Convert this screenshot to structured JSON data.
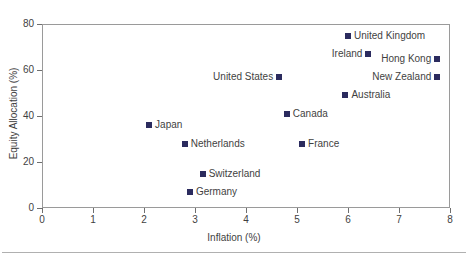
{
  "chart_data": {
    "type": "scatter",
    "title": "",
    "xlabel": "Inflation (%)",
    "ylabel": "Equity Allocation (%)",
    "xlim": [
      0,
      8
    ],
    "ylim": [
      0,
      80
    ],
    "xticks": [
      "0",
      "1",
      "2",
      "3",
      "4",
      "5",
      "6",
      "7",
      "8"
    ],
    "yticks": [
      "0",
      "20",
      "40",
      "60",
      "80"
    ],
    "grid": false,
    "legend": "none",
    "marker_color": "#2b2b5e",
    "points": [
      {
        "label": "United Kingdom",
        "x": 6.0,
        "y": 75,
        "label_side": "right"
      },
      {
        "label": "Ireland",
        "x": 6.4,
        "y": 67,
        "label_side": "left"
      },
      {
        "label": "Hong Kong",
        "x": 7.75,
        "y": 65,
        "label_side": "left"
      },
      {
        "label": "New Zealand",
        "x": 7.75,
        "y": 57,
        "label_side": "left"
      },
      {
        "label": "United States",
        "x": 4.65,
        "y": 57,
        "label_side": "left"
      },
      {
        "label": "Australia",
        "x": 5.95,
        "y": 49,
        "label_side": "right"
      },
      {
        "label": "Canada",
        "x": 4.8,
        "y": 41,
        "label_side": "right"
      },
      {
        "label": "Japan",
        "x": 2.1,
        "y": 36,
        "label_side": "right"
      },
      {
        "label": "Netherlands",
        "x": 2.8,
        "y": 28,
        "label_side": "right"
      },
      {
        "label": "France",
        "x": 5.1,
        "y": 28,
        "label_side": "right"
      },
      {
        "label": "Switzerland",
        "x": 3.15,
        "y": 15,
        "label_side": "right"
      },
      {
        "label": "Germany",
        "x": 2.9,
        "y": 7,
        "label_side": "right"
      }
    ]
  }
}
